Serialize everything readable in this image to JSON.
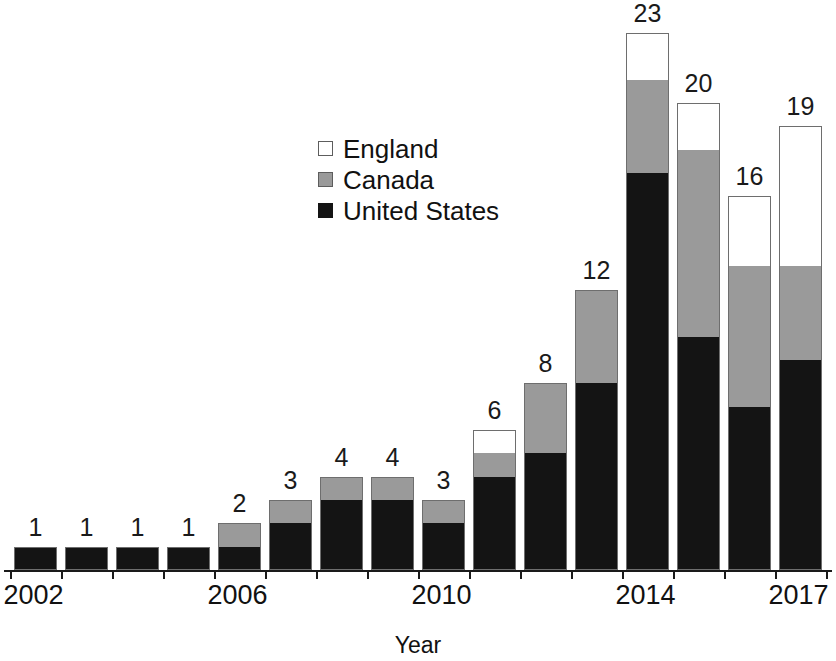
{
  "chart_data": {
    "type": "bar",
    "subtype": "stacked-bar",
    "title": "",
    "xlabel": "Year",
    "ylabel": "",
    "grid": false,
    "axis": {
      "y_visible": false,
      "x_visible": true,
      "ylim": [
        0,
        23
      ],
      "unit_label_position": "above-bar"
    },
    "legend": {
      "position": "upper-left-inside",
      "entries": [
        {
          "name": "England",
          "color": "#ffffff",
          "swatch": "open-square"
        },
        {
          "name": "Canada",
          "color": "#9a9a9a",
          "swatch": "gray-square"
        },
        {
          "name": "United States",
          "color": "#141414",
          "swatch": "filled-square"
        }
      ]
    },
    "categories": [
      "2002",
      "2003",
      "2004",
      "2005",
      "2006",
      "2007",
      "2008",
      "2009",
      "2010",
      "2011",
      "2012",
      "2013",
      "2014",
      "2015",
      "2016",
      "2017"
    ],
    "x_tick_labels_shown": [
      "2002",
      "2006",
      "2010",
      "2014",
      "2017"
    ],
    "series": [
      {
        "name": "United States",
        "color": "#141414",
        "values": [
          1,
          1,
          1,
          1,
          1,
          2,
          3,
          3,
          2,
          4,
          5,
          8,
          17,
          10,
          7,
          9
        ]
      },
      {
        "name": "Canada",
        "color": "#9a9a9a",
        "values": [
          0,
          0,
          0,
          0,
          1,
          1,
          1,
          1,
          1,
          1,
          3,
          4,
          4,
          8,
          6,
          4
        ]
      },
      {
        "name": "England",
        "color": "#ffffff",
        "values": [
          0,
          0,
          0,
          0,
          0,
          0,
          0,
          0,
          0,
          1,
          0,
          0,
          2,
          2,
          3,
          6
        ]
      }
    ],
    "totals": [
      1,
      1,
      1,
      1,
      2,
      3,
      4,
      4,
      3,
      6,
      8,
      12,
      23,
      20,
      16,
      19
    ],
    "total_labels": [
      "1",
      "1",
      "1",
      "1",
      "2",
      "3",
      "4",
      "4",
      "3",
      "6",
      "8",
      "12",
      "23",
      "20",
      "16",
      "19"
    ]
  },
  "axis_title": "Year"
}
